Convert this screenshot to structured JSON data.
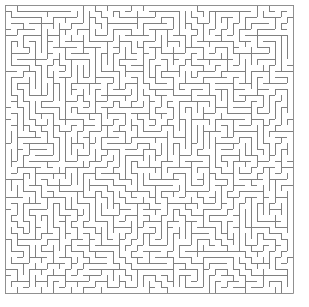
{
  "page": {
    "width": 309,
    "height": 307,
    "background_color": "#ffffff"
  },
  "maze": {
    "name": "rectangular-perfect-maze",
    "cols": 48,
    "rows": 48,
    "cell_size": 6,
    "origin_x": 5,
    "origin_y": 5,
    "wall_thickness": 1,
    "wall_color": "#808080",
    "border_color": "#909090",
    "passage_color": "#ffffff",
    "seed": 20240917,
    "algorithm": "randomized-depth-first-search",
    "entrance": "none-visible",
    "exit": "none-visible",
    "has_solution_path": false,
    "has_labels": false,
    "has_start_marker": false,
    "has_end_marker": false
  }
}
